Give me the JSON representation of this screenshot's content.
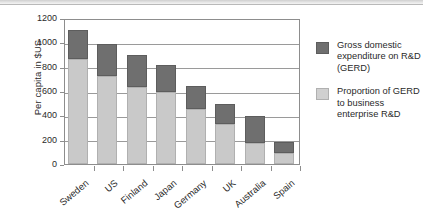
{
  "chart_data": {
    "type": "bar",
    "subtype": "stacked-vertical",
    "title": "",
    "xlabel": "",
    "ylabel": "Per capita in $US",
    "ylim": [
      0,
      1200
    ],
    "yticks": [
      0,
      200,
      400,
      600,
      800,
      1000,
      1200
    ],
    "ytick_labels": [
      "0",
      "200",
      "400",
      "600",
      "800",
      "1000",
      "1200"
    ],
    "grid": "horizontal",
    "legend_position": "right",
    "categories": [
      "Sweden",
      "US",
      "Finland",
      "Japan",
      "Germany",
      "UK",
      "Australia",
      "Spain"
    ],
    "series": [
      {
        "name": "Proportion of GERD to business enterprise R&D",
        "color": "#c9c9c9",
        "values": [
          860,
          720,
          630,
          590,
          455,
          325,
          175,
          90
        ]
      },
      {
        "name": "Gross domestic expenditure on R&D (GERD)",
        "color": "#6f6f6f",
        "values": [
          240,
          270,
          270,
          220,
          185,
          165,
          220,
          95
        ]
      }
    ],
    "totals": [
      1100,
      990,
      900,
      810,
      640,
      490,
      395,
      185
    ]
  },
  "legend": {
    "entries": [
      {
        "swatch": "dark",
        "label": "Gross domestic expenditure on R&D (GERD)"
      },
      {
        "swatch": "light",
        "label": "Proportion of GERD to business enterprise R&D"
      }
    ]
  }
}
